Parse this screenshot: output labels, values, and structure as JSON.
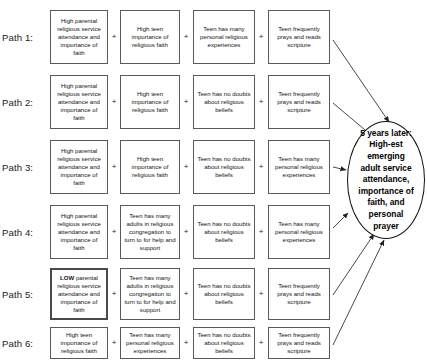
{
  "figure": {
    "title": "",
    "outcome": {
      "label": "5 years later: High-est emerging adult service attendance, importance of faith, and personal prayer",
      "shape": "oval"
    },
    "operator": "+",
    "paths": [
      {
        "label": "Path 1:",
        "steps": [
          {
            "text": "High parental religious service attendance and importance of faith",
            "emphasis": false,
            "bold_prefix": ""
          },
          {
            "text": "High teen importance of religious faith",
            "emphasis": false,
            "bold_prefix": ""
          },
          {
            "text": "Teen has many personal religious experiences",
            "emphasis": false,
            "bold_prefix": ""
          },
          {
            "text": "Teen frequently prays and reads scripture",
            "emphasis": false,
            "bold_prefix": ""
          }
        ]
      },
      {
        "label": "Path 2:",
        "steps": [
          {
            "text": "High parental religious service attendance and importance of faith",
            "emphasis": false,
            "bold_prefix": ""
          },
          {
            "text": "High teen importance of religious faith",
            "emphasis": false,
            "bold_prefix": ""
          },
          {
            "text": "Teen has no doubts about religious beliefs",
            "emphasis": false,
            "bold_prefix": ""
          },
          {
            "text": "Teen frequently prays and reads scripture",
            "emphasis": false,
            "bold_prefix": ""
          }
        ]
      },
      {
        "label": "Path 3:",
        "steps": [
          {
            "text": "High parental religious service attendance and importance of faith",
            "emphasis": false,
            "bold_prefix": ""
          },
          {
            "text": "High teen importance of religious faith",
            "emphasis": false,
            "bold_prefix": ""
          },
          {
            "text": "Teen has no doubts about religious beliefs",
            "emphasis": false,
            "bold_prefix": ""
          },
          {
            "text": "Teen has many personal religious experiences",
            "emphasis": false,
            "bold_prefix": ""
          }
        ]
      },
      {
        "label": "Path 4:",
        "steps": [
          {
            "text": "High parental religious service attendance and importance of faith",
            "emphasis": false,
            "bold_prefix": ""
          },
          {
            "text": "Teen has many adults in religious congregation to turn to for help and support",
            "emphasis": false,
            "bold_prefix": ""
          },
          {
            "text": "Teen has no doubts about religious beliefs",
            "emphasis": false,
            "bold_prefix": ""
          },
          {
            "text": "Teen has many personal religious experiences",
            "emphasis": false,
            "bold_prefix": ""
          }
        ]
      },
      {
        "label": "Path 5:",
        "steps": [
          {
            "text": "parental religious service attendance and importance of faith",
            "emphasis": true,
            "bold_prefix": "LOW"
          },
          {
            "text": "Teen has many adults in religious congregation to turn to for help and support",
            "emphasis": false,
            "bold_prefix": ""
          },
          {
            "text": "Teen has no doubts about religious beliefs",
            "emphasis": false,
            "bold_prefix": ""
          },
          {
            "text": "Teen frequently prays and reads scripture",
            "emphasis": false,
            "bold_prefix": ""
          }
        ]
      },
      {
        "label": "Path 6:",
        "steps": [
          {
            "text": "High teen importance of religious faith",
            "emphasis": false,
            "bold_prefix": ""
          },
          {
            "text": "Teen has many personal religious experiences",
            "emphasis": false,
            "bold_prefix": ""
          },
          {
            "text": "Teen has no doubts about religious beliefs",
            "emphasis": false,
            "bold_prefix": ""
          },
          {
            "text": "Teen frequently prays and reads scripture",
            "emphasis": false,
            "bold_prefix": ""
          }
        ]
      }
    ]
  },
  "layout": {
    "rows": [
      {
        "top": 10,
        "height": 54
      },
      {
        "top": 75,
        "height": 54
      },
      {
        "top": 140,
        "height": 54
      },
      {
        "top": 205,
        "height": 54
      },
      {
        "top": 268,
        "height": 52
      },
      {
        "top": 327,
        "height": 32
      }
    ],
    "columns": [
      {
        "left": 50,
        "width": 58
      },
      {
        "left": 120,
        "width": 60
      },
      {
        "left": 193,
        "width": 62
      },
      {
        "left": 268,
        "width": 62
      }
    ],
    "oval": {
      "left": 347,
      "top": 121,
      "width": 78,
      "height": 118
    },
    "arrows": [
      {
        "x1": 333,
        "y1": 40,
        "x2": 389,
        "y2": 122
      },
      {
        "x1": 333,
        "y1": 103,
        "x2": 371,
        "y2": 135
      },
      {
        "x1": 333,
        "y1": 167,
        "x2": 346,
        "y2": 170
      },
      {
        "x1": 333,
        "y1": 228,
        "x2": 348,
        "y2": 213
      },
      {
        "x1": 333,
        "y1": 295,
        "x2": 374,
        "y2": 234
      },
      {
        "x1": 333,
        "y1": 345,
        "x2": 384,
        "y2": 240
      }
    ],
    "colors": {
      "box_border": "#5a5a5a",
      "emphasis_border": "#4a4a4a",
      "oval_border": "#111111",
      "arrow": "#333333",
      "text": "#141414",
      "background": "#ffffff"
    }
  }
}
